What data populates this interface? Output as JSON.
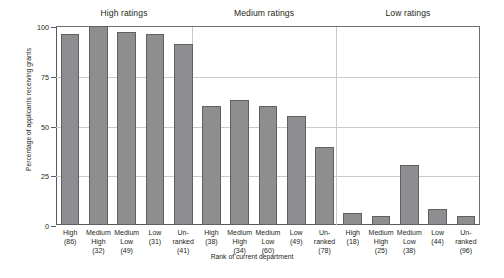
{
  "chart_data": {
    "type": "bar",
    "title": "",
    "xlabel": "Rank of current department",
    "ylabel": "Percentage of applicants receiving grants",
    "ylim": [
      0,
      100
    ],
    "yticks": [
      0,
      25,
      50,
      75,
      100
    ],
    "ytick_labels": [
      "0",
      "25",
      "50",
      "75",
      "100"
    ],
    "grid": true,
    "legend": "none",
    "group_labels": [
      "High ratings",
      "Medium ratings",
      "Low ratings"
    ],
    "categories": [
      "High (86)",
      "Medium High (32)",
      "Medium Low (49)",
      "Low (31)",
      "Un-ranked (41)",
      "High (38)",
      "Medium High (34)",
      "Medium Low (60)",
      "Low (49)",
      "Un-ranked (78)",
      "High (18)",
      "Medium High (25)",
      "Medium Low (38)",
      "Low (44)",
      "Un-ranked (96)"
    ],
    "values": [
      96,
      100,
      97,
      96,
      91,
      60,
      63,
      60,
      55,
      39,
      6,
      4.5,
      30,
      8,
      4.5
    ],
    "bars": [
      {
        "group": "High ratings",
        "rank": "High",
        "n": "(86)",
        "value": 96
      },
      {
        "group": "High ratings",
        "rank": "Medium High",
        "n": "(32)",
        "value": 100
      },
      {
        "group": "High ratings",
        "rank": "Medium Low",
        "n": "(49)",
        "value": 97
      },
      {
        "group": "High ratings",
        "rank": "Low",
        "n": "(31)",
        "value": 96
      },
      {
        "group": "High ratings",
        "rank": "Un- ranked",
        "n": "(41)",
        "value": 91
      },
      {
        "group": "Medium ratings",
        "rank": "High",
        "n": "(38)",
        "value": 60
      },
      {
        "group": "Medium ratings",
        "rank": "Medium High",
        "n": "(34)",
        "value": 63
      },
      {
        "group": "Medium ratings",
        "rank": "Medium Low",
        "n": "(60)",
        "value": 60
      },
      {
        "group": "Medium ratings",
        "rank": "Low",
        "n": "(49)",
        "value": 55
      },
      {
        "group": "Medium ratings",
        "rank": "Un- ranked",
        "n": "(78)",
        "value": 39
      },
      {
        "group": "Low ratings",
        "rank": "High",
        "n": "(18)",
        "value": 6
      },
      {
        "group": "Low ratings",
        "rank": "Medium High",
        "n": "(25)",
        "value": 4.5
      },
      {
        "group": "Low ratings",
        "rank": "Medium Low",
        "n": "(38)",
        "value": 30
      },
      {
        "group": "Low ratings",
        "rank": "Low",
        "n": "(44)",
        "value": 8
      },
      {
        "group": "Low ratings",
        "rank": "Un- ranked",
        "n": "(96)",
        "value": 4.5
      }
    ],
    "tick_lines": [
      [
        "High",
        "(86)"
      ],
      [
        "Medium",
        "High",
        "(32)"
      ],
      [
        "Medium",
        "Low",
        "(49)"
      ],
      [
        "Low",
        "(31)"
      ],
      [
        "Un-",
        "ranked",
        "(41)"
      ],
      [
        "High",
        "(38)"
      ],
      [
        "Medium",
        "High",
        "(34)"
      ],
      [
        "Medium",
        "Low",
        "(60)"
      ],
      [
        "Low",
        "(49)"
      ],
      [
        "Un-",
        "ranked",
        "(78)"
      ],
      [
        "High",
        "(18)"
      ],
      [
        "Medium",
        "High",
        "(25)"
      ],
      [
        "Medium",
        "Low",
        "(38)"
      ],
      [
        "Low",
        "(44)"
      ],
      [
        "Un-",
        "ranked",
        "(96)"
      ]
    ],
    "colors": {
      "bar_fill": "#8e8e90",
      "bar_edge": "#5f6062",
      "grid": "#c9cacc",
      "axis": "#58595b",
      "text": "#231f20",
      "background": "#ffffff"
    }
  }
}
